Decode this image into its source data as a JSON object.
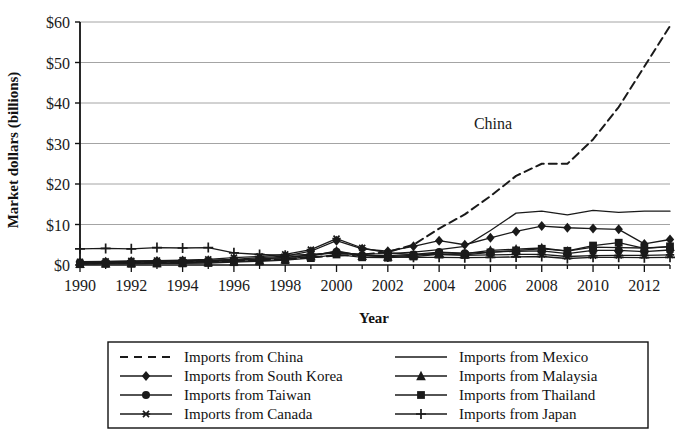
{
  "chart_data": {
    "type": "line",
    "title": "",
    "xlabel": "Year",
    "ylabel": "Market dollars (billions)",
    "xlim": [
      1990,
      2013
    ],
    "ylim": [
      0,
      60
    ],
    "ytick_labels": [
      "$0",
      "$10",
      "$20",
      "$30",
      "$40",
      "$50",
      "$60"
    ],
    "ytick_values": [
      0,
      10,
      20,
      30,
      40,
      50,
      60
    ],
    "xtick_labels": [
      "1990",
      "1992",
      "1994",
      "1996",
      "1998",
      "2000",
      "2002",
      "2004",
      "2006",
      "2008",
      "2010",
      "2012"
    ],
    "xtick_values": [
      1990,
      1992,
      1994,
      1996,
      1998,
      2000,
      2002,
      2004,
      2006,
      2008,
      2010,
      2012
    ],
    "grid": "horizontal",
    "legend_position": "below-plot",
    "annotations": [
      {
        "text": "China",
        "x": 2006.1,
        "y": 33.5
      }
    ],
    "x": [
      1990,
      1991,
      1992,
      1993,
      1994,
      1995,
      1996,
      1997,
      1998,
      1999,
      2000,
      2001,
      2002,
      2003,
      2004,
      2005,
      2006,
      2007,
      2008,
      2009,
      2010,
      2011,
      2012,
      2013
    ],
    "series": [
      {
        "name": "Imports from China",
        "marker": "none",
        "dash": "dashed",
        "values": [
          0.4,
          0.5,
          0.6,
          0.7,
          0.8,
          0.9,
          1.0,
          1.2,
          1.5,
          1.9,
          2.3,
          2.6,
          3.2,
          5.0,
          9.0,
          12.5,
          17.0,
          22.0,
          25.0,
          25.0,
          31.0,
          39.0,
          49.0,
          59.0
        ]
      },
      {
        "name": "Imports from South Korea",
        "marker": "diamond",
        "dash": "solid",
        "values": [
          0.7,
          0.8,
          0.9,
          1.0,
          1.1,
          1.2,
          1.4,
          1.8,
          2.2,
          3.4,
          6.0,
          4.0,
          3.4,
          4.6,
          6.0,
          5.0,
          6.7,
          8.3,
          9.6,
          9.2,
          9.0,
          8.8,
          5.2,
          6.3
        ]
      },
      {
        "name": "Imports from Taiwan",
        "marker": "circle",
        "dash": "solid",
        "values": [
          0.6,
          0.6,
          0.7,
          0.8,
          0.9,
          1.0,
          1.2,
          1.5,
          1.8,
          2.4,
          3.3,
          2.4,
          2.3,
          2.6,
          3.2,
          2.9,
          3.2,
          3.4,
          3.5,
          2.8,
          3.6,
          3.6,
          3.3,
          3.7
        ]
      },
      {
        "name": "Imports from Canada",
        "marker": "star",
        "dash": "solid",
        "values": [
          0.8,
          0.9,
          1.0,
          1.1,
          1.2,
          1.4,
          1.8,
          2.1,
          2.6,
          3.8,
          6.5,
          4.2,
          3.0,
          2.6,
          2.6,
          2.4,
          2.5,
          2.6,
          2.6,
          2.1,
          2.3,
          2.4,
          2.4,
          2.5
        ]
      },
      {
        "name": "Imports from Mexico",
        "marker": "none",
        "dash": "solid",
        "values": [
          0.5,
          0.6,
          0.7,
          0.8,
          0.9,
          1.0,
          1.2,
          1.5,
          1.9,
          2.5,
          3.0,
          2.7,
          2.8,
          3.2,
          3.8,
          4.6,
          8.5,
          12.8,
          13.3,
          12.4,
          13.5,
          13.0,
          13.3,
          13.3
        ]
      },
      {
        "name": "Imports from Malaysia",
        "marker": "triangle",
        "dash": "solid",
        "values": [
          0.3,
          0.4,
          0.5,
          0.5,
          0.6,
          0.7,
          0.9,
          1.1,
          1.4,
          2.2,
          3.5,
          2.3,
          2.1,
          2.4,
          3.0,
          2.8,
          3.6,
          3.9,
          4.2,
          3.4,
          4.4,
          4.3,
          4.2,
          4.5
        ]
      },
      {
        "name": "Imports from Thailand",
        "marker": "square",
        "dash": "solid",
        "values": [
          0.2,
          0.3,
          0.3,
          0.4,
          0.4,
          0.5,
          0.7,
          0.9,
          1.2,
          1.7,
          2.6,
          1.9,
          1.8,
          2.1,
          2.6,
          2.5,
          3.1,
          3.6,
          4.0,
          3.5,
          4.8,
          5.5,
          4.1,
          4.6
        ]
      },
      {
        "name": "Imports from Japan",
        "marker": "plus",
        "dash": "solid",
        "values": [
          4.0,
          4.1,
          4.0,
          4.3,
          4.2,
          4.3,
          3.0,
          2.6,
          2.4,
          2.6,
          3.0,
          2.4,
          2.0,
          1.9,
          1.9,
          1.8,
          1.9,
          2.0,
          2.1,
          1.6,
          1.9,
          1.9,
          1.8,
          1.9
        ]
      }
    ]
  },
  "legend": {
    "entries": [
      {
        "label": "Imports from China",
        "marker": "none",
        "dash": "dashed",
        "column": 0
      },
      {
        "label": "Imports from South Korea",
        "marker": "diamond",
        "dash": "solid",
        "column": 0
      },
      {
        "label": "Imports from Taiwan",
        "marker": "circle",
        "dash": "solid",
        "column": 0
      },
      {
        "label": "Imports from Canada",
        "marker": "star",
        "dash": "solid",
        "column": 0
      },
      {
        "label": "Imports from Mexico",
        "marker": "none",
        "dash": "solid",
        "column": 1
      },
      {
        "label": "Imports from Malaysia",
        "marker": "triangle",
        "dash": "solid",
        "column": 1
      },
      {
        "label": "Imports from Thailand",
        "marker": "square",
        "dash": "solid",
        "column": 1
      },
      {
        "label": "Imports from Japan",
        "marker": "plus",
        "dash": "solid",
        "column": 1
      }
    ]
  },
  "colors": {
    "line": "#1a1a1a",
    "grid": "#9a9a9a",
    "axis": "#111111",
    "background": "#ffffff"
  }
}
